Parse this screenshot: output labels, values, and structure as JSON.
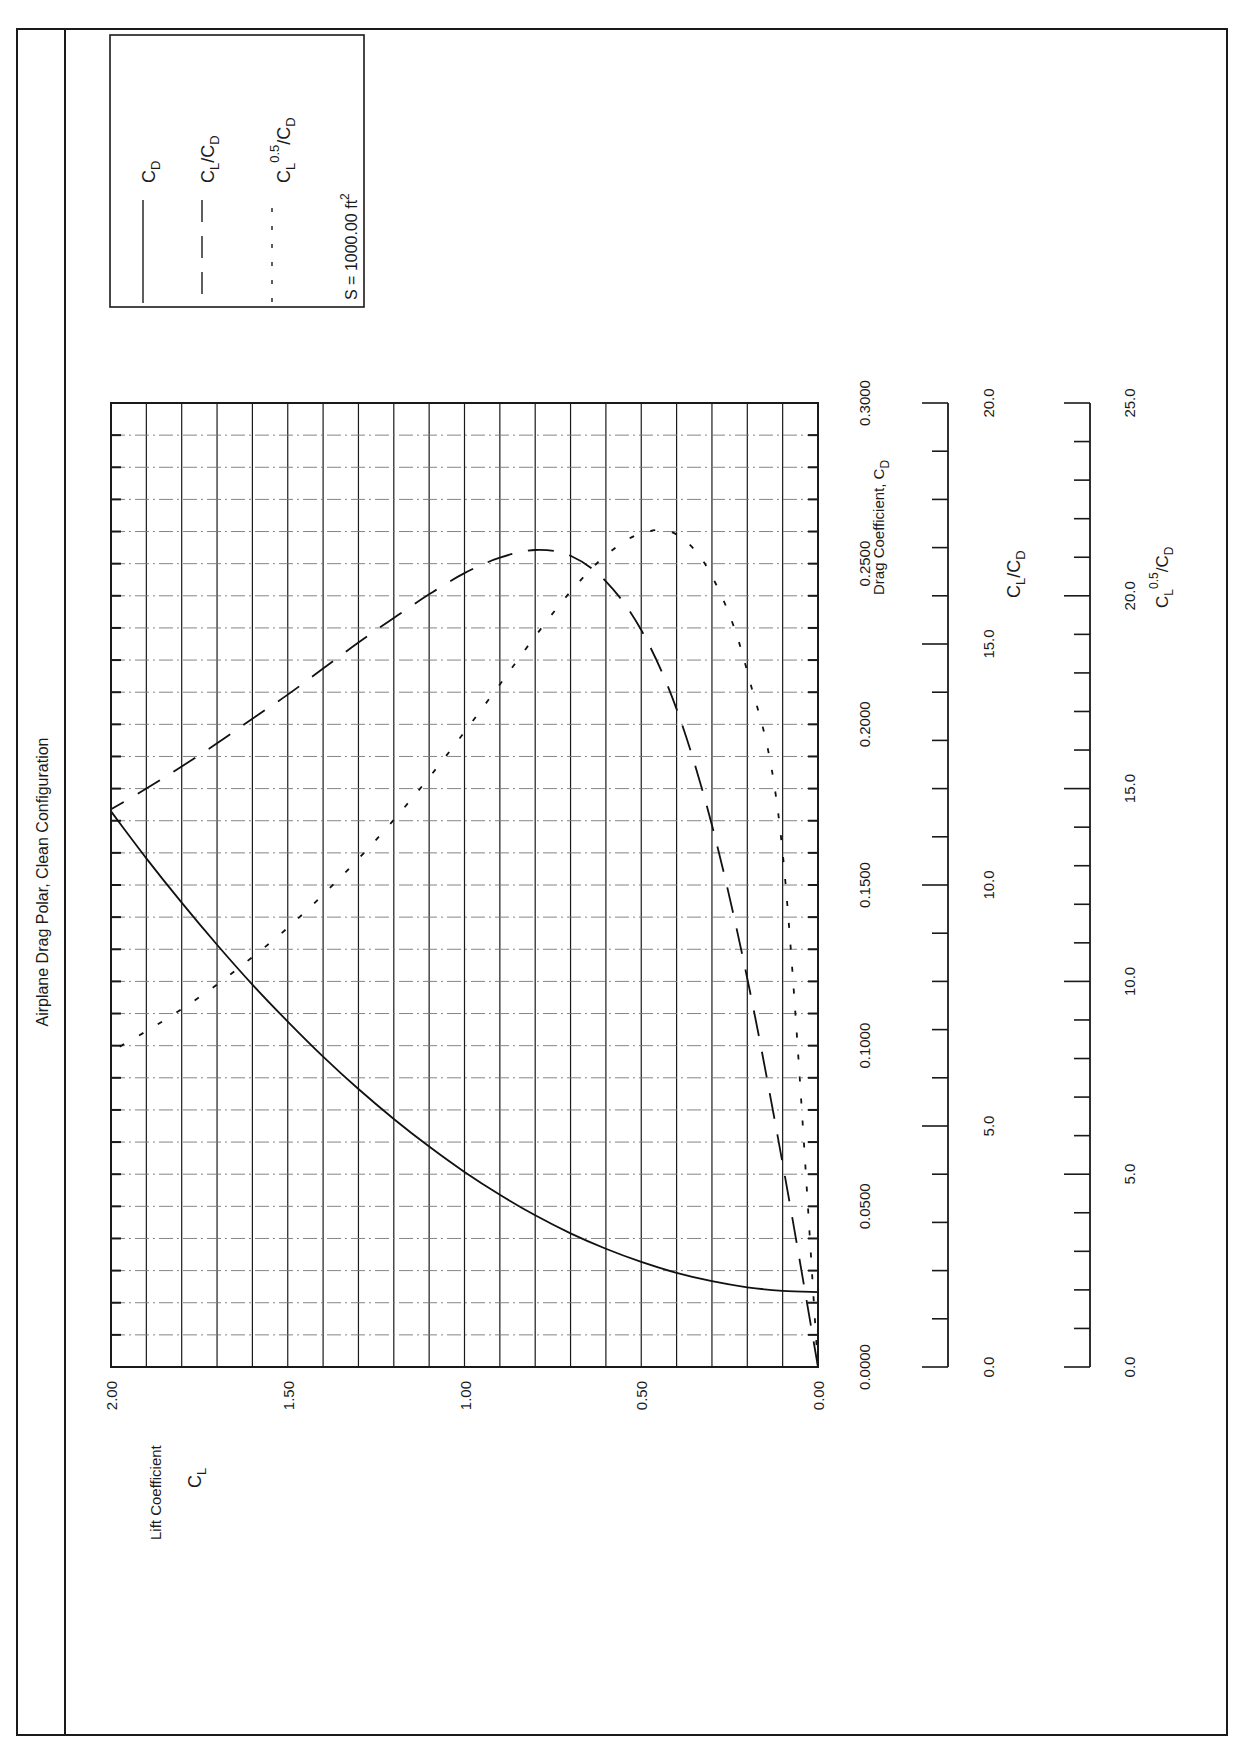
{
  "page": {
    "title": "Airplane Drag Polar, Clean Configuration",
    "legend": {
      "items": [
        {
          "label_main": "C",
          "label_sub": "D",
          "style": "solid"
        },
        {
          "label_main": "C",
          "label_sub": "L",
          "label_tail": "/C",
          "label_tail_sub": "D",
          "style": "dashed"
        },
        {
          "label_main": "C",
          "label_sub": "L",
          "label_sup": "0.5",
          "label_tail": "/C",
          "label_tail_sub": "D",
          "style": "dotted"
        }
      ],
      "note_prefix": "S = 1000.00 ft",
      "note_sup": "2"
    },
    "axes": {
      "cl_title": "Lift Coefficient",
      "cl_symbol": "C",
      "cl_symbol_sub": "L",
      "cl_ticks": [
        "2.00",
        "1.50",
        "1.00",
        "0.50",
        "0.00"
      ],
      "cd_title": "Drag Coefficient, C",
      "cd_title_sub": "D",
      "cd_ticks": [
        "0.0000",
        "0.0500",
        "0.1000",
        "0.1500",
        "0.2000",
        "0.2500",
        "0.3000"
      ],
      "ld_title": "C",
      "ld_title_sub": "L",
      "ld_title_tail": "/C",
      "ld_title_tail_sub": "D",
      "ld_ticks": [
        "0.0",
        "5.0",
        "10.0",
        "15.0",
        "20.0"
      ],
      "eff_title": "C",
      "eff_title_sub": "L",
      "eff_title_sup": "0.5",
      "eff_title_tail": "/C",
      "eff_title_tail_sub": "D",
      "eff_ticks": [
        "0.0",
        "5.0",
        "10.0",
        "15.0",
        "20.0",
        "25.0"
      ]
    }
  },
  "chart_data": {
    "type": "line",
    "title": "Airplane Drag Polar, Clean Configuration",
    "orientation": "rotated 90 degrees counter-clockwise (page landscape printed on portrait)",
    "xlabel": "Lift Coefficient C_L",
    "xlim": [
      0.0,
      2.0
    ],
    "x_ticks": [
      0.0,
      0.5,
      1.0,
      1.5,
      2.0
    ],
    "x_grid_step": 0.1,
    "y_axes": [
      {
        "name": "Drag Coefficient, C_D",
        "ylim": [
          0.0,
          0.3
        ],
        "ticks": [
          0.0,
          0.05,
          0.1,
          0.15,
          0.2,
          0.25,
          0.3
        ],
        "grid_step": 0.01
      },
      {
        "name": "C_L/C_D",
        "ylim": [
          0.0,
          20.0
        ],
        "ticks": [
          0.0,
          5.0,
          10.0,
          15.0,
          20.0
        ],
        "minor_step": 1.0
      },
      {
        "name": "C_L^0.5/C_D",
        "ylim": [
          0.0,
          25.0
        ],
        "ticks": [
          0.0,
          5.0,
          10.0,
          15.0,
          20.0,
          25.0
        ],
        "minor_step": 1.0
      }
    ],
    "x": [
      0.0,
      0.1,
      0.2,
      0.3,
      0.4,
      0.5,
      0.6,
      0.7,
      0.8,
      0.9,
      1.0,
      1.1,
      1.2,
      1.3,
      1.4,
      1.5,
      1.6,
      1.7,
      1.8,
      1.9,
      2.0
    ],
    "series": [
      {
        "name": "C_D",
        "style": "solid",
        "axis": 0,
        "values": [
          0.0233,
          0.0237,
          0.0248,
          0.0267,
          0.0293,
          0.0327,
          0.0368,
          0.0416,
          0.0472,
          0.0536,
          0.0607,
          0.0686,
          0.0772,
          0.0865,
          0.0966,
          0.1075,
          0.119,
          0.1314,
          0.1445,
          0.1583,
          0.1729
        ]
      },
      {
        "name": "C_L/C_D",
        "style": "dashed",
        "axis": 1,
        "values": [
          0.0,
          4.22,
          8.06,
          11.24,
          13.65,
          15.29,
          16.3,
          16.83,
          16.95,
          16.79,
          16.47,
          16.03,
          15.54,
          15.03,
          14.49,
          13.95,
          13.45,
          12.94,
          12.46,
          12.0,
          11.57
        ]
      },
      {
        "name": "C_L^0.5/C_D",
        "style": "dotted",
        "axis": 2,
        "values": [
          0.0,
          13.34,
          18.03,
          20.51,
          21.59,
          21.62,
          21.05,
          20.11,
          18.95,
          17.7,
          16.47,
          15.29,
          14.19,
          13.18,
          12.25,
          11.39,
          10.63,
          9.92,
          9.28,
          8.71,
          8.18
        ]
      }
    ],
    "annotations": [
      "S = 1000.00 ft^2"
    ],
    "legend": [
      "C_D",
      "C_L/C_D",
      "C_L^0.5/C_D"
    ],
    "legend_position": "top-right (rotated)",
    "grid": true
  }
}
